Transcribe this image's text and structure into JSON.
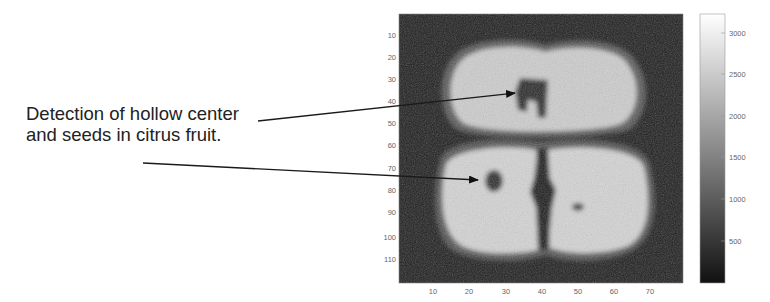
{
  "annotation": {
    "lines": [
      "Detection of hollow center",
      "and seeds in citrus fruit."
    ],
    "arrows": [
      {
        "label": "hollow-center",
        "from": [
          258,
          121
        ],
        "to": [
          515,
          93
        ]
      },
      {
        "label": "seeds",
        "from": [
          143,
          163
        ],
        "to": [
          478,
          180
        ]
      }
    ]
  },
  "image_axes": {
    "x_ticks": [
      "10",
      "20",
      "30",
      "40",
      "50",
      "60",
      "70"
    ],
    "y_ticks": [
      "10",
      "20",
      "30",
      "40",
      "50",
      "60",
      "70",
      "80",
      "90",
      "100",
      "110"
    ]
  },
  "colorbar": {
    "ticks": [
      "3000",
      "2500",
      "2000",
      "1500",
      "1000",
      "500"
    ],
    "min_color": "#111111",
    "max_color": "#ffffff"
  },
  "colors": {
    "background": "#ffffff",
    "image_bg": "#1e1e1e",
    "fruit_flesh": "#cfcfcf",
    "text": "#222222"
  }
}
